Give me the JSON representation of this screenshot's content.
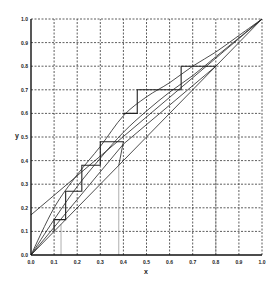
{
  "chart_data": {
    "type": "line",
    "title": "",
    "xlabel": "x",
    "ylabel": "y",
    "xlim": [
      0,
      1
    ],
    "ylim": [
      0,
      1
    ],
    "grid": true,
    "x_ticks": [
      "0.0",
      "0.1",
      "0.2",
      "0.3",
      "0.4",
      "0.5",
      "0.6",
      "0.7",
      "0.8",
      "0.9",
      "1.0"
    ],
    "y_ticks": [
      "0.0",
      "0.1",
      "0.2",
      "0.3",
      "0.4",
      "0.5",
      "0.6",
      "0.7",
      "0.8",
      "0.9",
      "1.0"
    ],
    "series": [
      {
        "name": "diagonal y=x",
        "x": [
          0,
          1
        ],
        "y": [
          0,
          1
        ]
      },
      {
        "name": "equilibrium curve",
        "x": [
          0,
          0.1,
          0.2,
          0.3,
          0.4,
          0.5,
          0.6,
          0.7,
          0.8,
          0.9,
          1.0
        ],
        "y": [
          0,
          0.15,
          0.29,
          0.41,
          0.52,
          0.61,
          0.69,
          0.76,
          0.84,
          0.92,
          1.0
        ]
      },
      {
        "name": "upper curve",
        "x": [
          0,
          0.1,
          0.2,
          0.3,
          0.4,
          0.5,
          0.6,
          0.7,
          0.8,
          0.9,
          1.0
        ],
        "y": [
          0,
          0.2,
          0.34,
          0.46,
          0.59,
          0.67,
          0.73,
          0.8,
          0.86,
          0.93,
          1.0
        ]
      },
      {
        "name": "rectifying operating line",
        "x": [
          0,
          1
        ],
        "y": [
          0.17,
          1.0
        ]
      },
      {
        "name": "stripping line",
        "x": [
          0,
          0.4,
          0.8
        ],
        "y": [
          0,
          0.47,
          0.8
        ]
      },
      {
        "name": "q-line",
        "x": [
          0.38,
          0.4
        ],
        "y": [
          0.38,
          0.48
        ]
      },
      {
        "name": "stages upper",
        "x": [
          0.8,
          0.65,
          0.65,
          0.46,
          0.46,
          0.4
        ],
        "y": [
          0.8,
          0.8,
          0.7,
          0.7,
          0.6,
          0.6
        ]
      },
      {
        "name": "stages lower",
        "x": [
          0.4,
          0.3,
          0.3,
          0.22,
          0.22,
          0.15,
          0.15,
          0.1,
          0.1
        ],
        "y": [
          0.48,
          0.48,
          0.38,
          0.38,
          0.27,
          0.27,
          0.15,
          0.15,
          0.1
        ]
      }
    ],
    "vertical_markers": [
      0.13,
      0.38,
      0.8
    ]
  },
  "labels": {
    "x_axis": "x",
    "y_axis": "y"
  }
}
